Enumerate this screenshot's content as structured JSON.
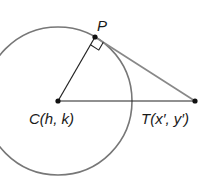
{
  "diagram": {
    "type": "geometry-tangent",
    "colors": {
      "circle": "#777777",
      "segments": "#222222",
      "tangent": "#888888",
      "points": "#111111"
    },
    "circle": {
      "cx": 58,
      "cy": 101,
      "r": 74
    },
    "points": {
      "P": {
        "label": "P",
        "x": 95,
        "y": 37
      },
      "C": {
        "label": "C(h, k)",
        "x": 58,
        "y": 101
      },
      "T": {
        "label": "T(x′, y′)",
        "x": 195,
        "y": 101
      }
    },
    "segments": [
      {
        "from": "C",
        "to": "P",
        "name": "radius"
      },
      {
        "from": "C",
        "to": "T",
        "name": "center-to-external-point"
      },
      {
        "from": "P",
        "to": "T",
        "name": "tangent"
      }
    ],
    "right_angle_at": "P"
  }
}
